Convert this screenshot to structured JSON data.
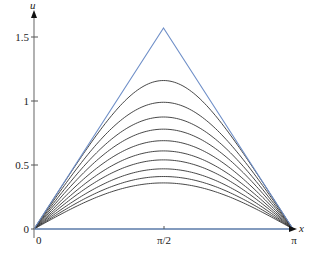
{
  "chart_data": {
    "type": "line",
    "title": "",
    "xlabel": "x",
    "ylabel": "u",
    "xlim": [
      0,
      3.14159
    ],
    "ylim": [
      0,
      1.6
    ],
    "grid": false,
    "legend": null,
    "x_ticks": [
      {
        "value": 0,
        "label": "0"
      },
      {
        "value": 1.5708,
        "label": "π/2"
      },
      {
        "value": 3.14159,
        "label": "π"
      }
    ],
    "y_ticks": [
      {
        "value": 0,
        "label": "0"
      },
      {
        "value": 0.5,
        "label": "0.5"
      },
      {
        "value": 1,
        "label": "1"
      },
      {
        "value": 1.5,
        "label": "1.5"
      }
    ],
    "initial_condition": {
      "name": "triangle",
      "color": "#6f8fc8",
      "points": [
        [
          0,
          0
        ],
        [
          1.5708,
          1.5708
        ],
        [
          3.14159,
          0
        ]
      ]
    },
    "curves": {
      "color": "#333333",
      "shape": "symmetric arches vanishing at x=0 and x=π, decreasing with time",
      "peak_values_at_pi_over_2": [
        1.16,
        0.99,
        0.875,
        0.78,
        0.69,
        0.61,
        0.54,
        0.47,
        0.41,
        0.36
      ]
    },
    "axis_colors": {
      "y_axis": "#888888",
      "x_axis": "#5a7aa8"
    }
  },
  "labels": {
    "y_axis_name": "u",
    "x_axis_name": "x",
    "y_tick_0": "0",
    "y_tick_05": "0.5",
    "y_tick_1": "1",
    "y_tick_15": "1.5",
    "x_tick_0": "0",
    "x_tick_mid": "π/2",
    "x_tick_end": "π"
  }
}
